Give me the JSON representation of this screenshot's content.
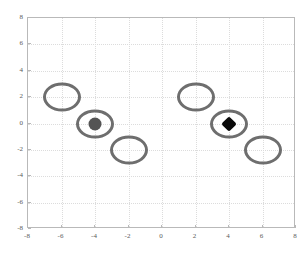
{
  "chart_data": {
    "type": "scatter",
    "title": "",
    "xlabel": "",
    "ylabel": "",
    "xlim": [
      -8,
      8
    ],
    "ylim": [
      -8,
      8
    ],
    "grid": true,
    "legend": null,
    "xticks": [
      "-8",
      "-6",
      "-4",
      "-2",
      "0",
      "2",
      "4",
      "6",
      "8"
    ],
    "xtick_values": [
      -8,
      -6,
      -4,
      -2,
      0,
      2,
      4,
      6,
      8
    ],
    "yticks": [
      "8",
      "6",
      "4",
      "2",
      "0",
      "-2",
      "-4",
      "-6",
      "-8"
    ],
    "ytick_values": [
      8,
      6,
      4,
      2,
      0,
      -2,
      -4,
      -6,
      -8
    ],
    "series": [
      {
        "name": "open-ellipse",
        "marker": "ellipse-outline",
        "color": "#6e6e6e",
        "points": [
          {
            "x": -6,
            "y": 2
          },
          {
            "x": -4,
            "y": 0
          },
          {
            "x": -2,
            "y": -2
          },
          {
            "x": 2,
            "y": 2
          },
          {
            "x": 4,
            "y": 0
          },
          {
            "x": 6,
            "y": -2
          }
        ]
      },
      {
        "name": "filled-circle",
        "marker": "circle-filled",
        "color": "#545454",
        "points": [
          {
            "x": -4,
            "y": 0
          }
        ]
      },
      {
        "name": "filled-diamond",
        "marker": "diamond-filled",
        "color": "#0a0a0a",
        "points": [
          {
            "x": 4,
            "y": 0
          }
        ]
      }
    ]
  },
  "axes": {
    "frame_color": "#b9b9b9",
    "grid_color": "#dcdcdc",
    "tick_color": "#5a5a5a"
  }
}
